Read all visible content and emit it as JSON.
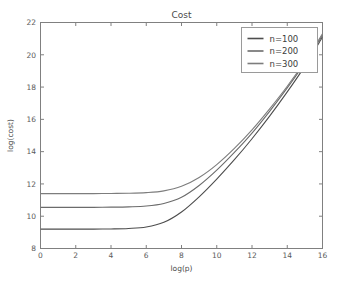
{
  "chart_data": {
    "type": "line",
    "title": "Cost",
    "xlabel": "log(p)",
    "ylabel": "log(cost)",
    "xlim": [
      0,
      16
    ],
    "ylim": [
      8,
      22
    ],
    "xticks": [
      0,
      2,
      4,
      6,
      8,
      10,
      12,
      14,
      16
    ],
    "yticks": [
      8,
      10,
      12,
      14,
      16,
      18,
      20,
      22
    ],
    "grid": false,
    "legend_position": "upper right",
    "x": [
      0,
      1,
      2,
      3,
      4,
      5,
      6,
      7,
      8,
      9,
      10,
      11,
      12,
      13,
      14,
      15,
      16
    ],
    "series": [
      {
        "name": "n=100",
        "color": "#4d4d4d",
        "values": [
          9.2,
          9.2,
          9.2,
          9.2,
          9.21,
          9.24,
          9.33,
          9.62,
          10.26,
          11.2,
          12.3,
          13.5,
          14.8,
          16.2,
          17.7,
          19.3,
          21.1
        ]
      },
      {
        "name": "n=200",
        "color": "#6b6b6b",
        "values": [
          10.55,
          10.55,
          10.55,
          10.55,
          10.56,
          10.58,
          10.63,
          10.79,
          11.17,
          11.9,
          12.85,
          13.95,
          15.15,
          16.5,
          17.95,
          19.5,
          21.2
        ]
      },
      {
        "name": "n=300",
        "color": "#7d7d7d",
        "values": [
          11.4,
          11.4,
          11.4,
          11.4,
          11.41,
          11.42,
          11.46,
          11.57,
          11.85,
          12.4,
          13.2,
          14.2,
          15.35,
          16.65,
          18.05,
          19.6,
          21.3
        ]
      }
    ]
  },
  "legend": {
    "items": [
      {
        "label": "n=100"
      },
      {
        "label": "n=200"
      },
      {
        "label": "n=300"
      }
    ]
  }
}
